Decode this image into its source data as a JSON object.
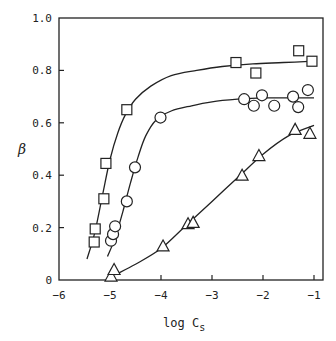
{
  "chart_data": {
    "type": "scatter",
    "title": "",
    "xlabel": "log C",
    "xlabel_subscript": "s",
    "ylabel": "β",
    "xlim": [
      -6,
      -0.8
    ],
    "ylim": [
      0,
      1.0
    ],
    "x_ticks": [
      -6,
      -5,
      -4,
      -3,
      -2,
      -1
    ],
    "x_tick_labels": [
      "-6",
      "-5",
      "-4",
      "-3",
      "-2",
      "-1"
    ],
    "y_ticks": [
      0,
      0.2,
      0.4,
      0.6,
      0.8,
      1.0
    ],
    "y_tick_labels": [
      "0",
      "0.2",
      "0.4",
      "0.6",
      "0.8",
      "1.0"
    ],
    "grid": false,
    "legend": null,
    "series": [
      {
        "name": "squares",
        "marker": "square",
        "x": [
          -5.31,
          -5.29,
          -5.12,
          -5.08,
          -4.67,
          -2.53,
          -2.14,
          -1.3,
          -1.04
        ],
        "y": [
          0.145,
          0.195,
          0.31,
          0.445,
          0.65,
          0.83,
          0.79,
          0.875,
          0.835
        ],
        "curve": {
          "x": [
            -5.45,
            -5.3,
            -5.15,
            -5.0,
            -4.85,
            -4.7,
            -4.5,
            -4.2,
            -3.8,
            -3.3,
            -2.8,
            -2.2,
            -1.6,
            -1.0
          ],
          "y": [
            0.08,
            0.18,
            0.32,
            0.46,
            0.56,
            0.63,
            0.69,
            0.74,
            0.78,
            0.8,
            0.815,
            0.825,
            0.83,
            0.835
          ]
        }
      },
      {
        "name": "circles",
        "marker": "circle",
        "x": [
          -4.98,
          -4.94,
          -4.9,
          -4.67,
          -4.51,
          -4.01,
          -2.37,
          -2.18,
          -2.02,
          -1.78,
          -1.41,
          -1.31,
          -1.12
        ],
        "y": [
          0.15,
          0.175,
          0.205,
          0.3,
          0.43,
          0.62,
          0.69,
          0.665,
          0.705,
          0.665,
          0.7,
          0.66,
          0.725
        ],
        "curve": {
          "x": [
            -5.05,
            -4.9,
            -4.75,
            -4.6,
            -4.45,
            -4.3,
            -4.1,
            -3.8,
            -3.4,
            -3.0,
            -2.5,
            -2.0,
            -1.5,
            -1.0
          ],
          "y": [
            0.09,
            0.16,
            0.26,
            0.37,
            0.47,
            0.55,
            0.61,
            0.645,
            0.665,
            0.68,
            0.69,
            0.695,
            0.695,
            0.695
          ]
        }
      },
      {
        "name": "triangles",
        "marker": "triangle",
        "x": [
          -4.98,
          -4.92,
          -3.96,
          -3.47,
          -3.37,
          -2.41,
          -2.08,
          -1.37,
          -1.08
        ],
        "y": [
          0.015,
          0.04,
          0.13,
          0.215,
          0.22,
          0.4,
          0.475,
          0.575,
          0.56
        ],
        "curve": {
          "x": [
            -4.9,
            -4.5,
            -4.0,
            -3.5,
            -3.0,
            -2.5,
            -2.0,
            -1.5,
            -1.0
          ],
          "y": [
            0.02,
            0.06,
            0.12,
            0.21,
            0.3,
            0.39,
            0.48,
            0.55,
            0.59
          ]
        }
      }
    ]
  },
  "colors": {
    "ink": "#222222",
    "background": "#ffffff"
  }
}
